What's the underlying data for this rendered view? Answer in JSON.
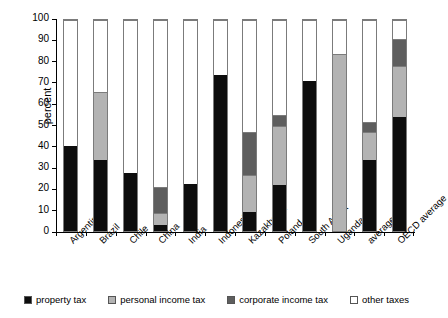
{
  "chart_data": {
    "type": "bar",
    "stacked": true,
    "title": "",
    "xlabel": "",
    "ylabel": "percent",
    "ylim": [
      0,
      100
    ],
    "yticks": [
      0,
      10,
      20,
      30,
      40,
      50,
      60,
      70,
      80,
      90,
      100
    ],
    "grid": false,
    "legend_position": "bottom",
    "categories": [
      "Argentina",
      "Brazil",
      "Chile",
      "China",
      "India",
      "Indonesia",
      "Kazakhstan",
      "Poland",
      "South Africa",
      "Uganda",
      "average",
      "OECD average"
    ],
    "series": [
      {
        "name": "property tax",
        "color": "#0d0d0d",
        "values": [
          40.5,
          33.5,
          27.5,
          3,
          22.5,
          74,
          9,
          22,
          71,
          0,
          33.5,
          54
        ]
      },
      {
        "name": "personal income tax",
        "color": "#b3b3b3",
        "values": [
          0,
          32.5,
          0,
          5.5,
          0,
          0,
          17.5,
          28,
          0,
          84,
          13.5,
          24
        ]
      },
      {
        "name": "corporate income tax",
        "color": "#5e5e5e",
        "values": [
          0,
          0,
          0,
          12.5,
          0,
          0,
          20.5,
          5,
          0,
          0,
          4.5,
          13
        ]
      },
      {
        "name": "other taxes",
        "color": "#ffffff",
        "values": [
          59.5,
          34,
          72.5,
          79,
          77.5,
          26,
          53,
          45,
          29,
          16,
          48.5,
          9
        ]
      }
    ]
  }
}
